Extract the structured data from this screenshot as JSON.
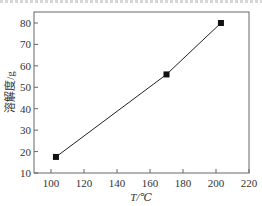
{
  "chart_data": {
    "type": "line",
    "title": "",
    "xlabel": "T/℃",
    "ylabel": "溶解度/g",
    "x": [
      103,
      170,
      203
    ],
    "series": [
      {
        "name": "溶解度",
        "values": [
          17.5,
          56,
          80
        ],
        "marker": "square",
        "color": "#111111"
      }
    ],
    "xlim": [
      95,
      220
    ],
    "ylim": [
      10,
      85
    ],
    "xticks": [
      100,
      120,
      140,
      160,
      180,
      200,
      220
    ],
    "yticks": [
      10,
      20,
      30,
      40,
      50,
      60,
      70,
      80
    ],
    "grid": false,
    "legend": null
  },
  "labels": {
    "xlabel": "T/℃",
    "ylabel": "溶解度/g",
    "xticks": [
      "100",
      "120",
      "140",
      "160",
      "180",
      "200",
      "220"
    ],
    "yticks": [
      "10",
      "20",
      "30",
      "40",
      "50",
      "60",
      "70",
      "80"
    ]
  }
}
